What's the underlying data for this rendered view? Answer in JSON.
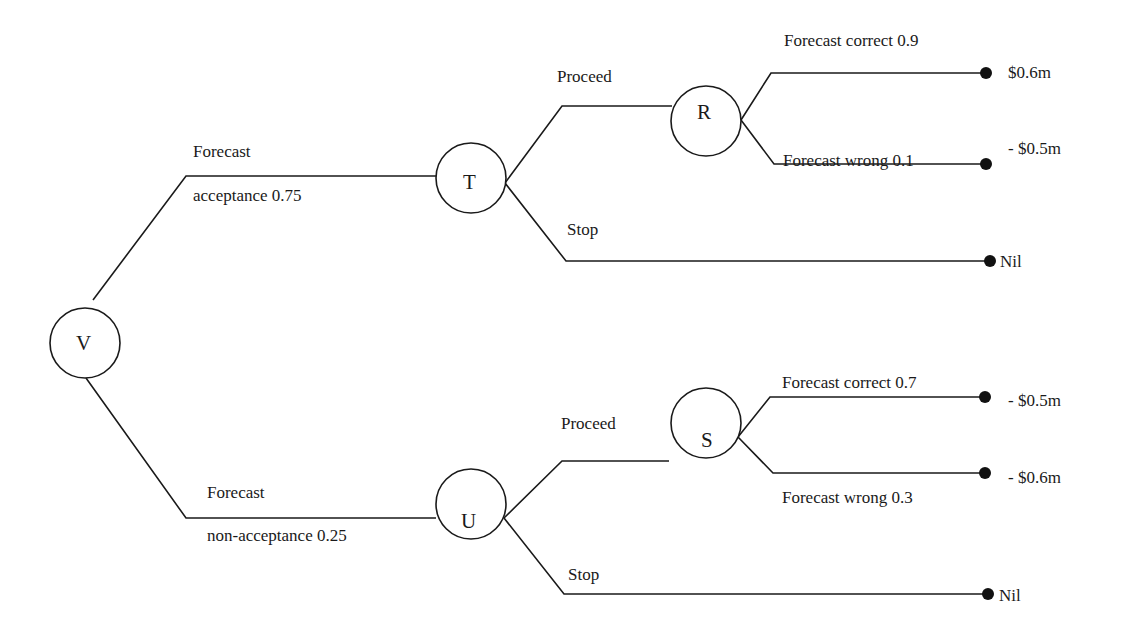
{
  "diagram": {
    "type": "decision-tree",
    "nodes": {
      "V": {
        "label": "V"
      },
      "T": {
        "label": "T"
      },
      "U": {
        "label": "U"
      },
      "R": {
        "label": "R"
      },
      "S": {
        "label": "S"
      }
    },
    "branches": {
      "v_t": {
        "line1": "Forecast",
        "line2": "acceptance 0.75"
      },
      "v_u": {
        "line1": "Forecast",
        "line2": "non-acceptance 0.25"
      },
      "t_proceed": {
        "label": "Proceed"
      },
      "t_stop": {
        "label": "Stop"
      },
      "u_proceed": {
        "label": "Proceed"
      },
      "u_stop": {
        "label": "Stop"
      },
      "r_correct": {
        "label": "Forecast correct 0.9"
      },
      "r_wrong": {
        "label": "Forecast wrong 0.1"
      },
      "s_correct": {
        "label": "Forecast correct 0.7"
      },
      "s_wrong": {
        "label": "Forecast wrong 0.3"
      }
    },
    "outcomes": {
      "r_correct": "$0.6m",
      "r_wrong": "- $0.5m",
      "t_stop": "Nil",
      "s_correct": "- $0.5m",
      "s_wrong": "- $0.6m",
      "u_stop": "Nil"
    }
  }
}
